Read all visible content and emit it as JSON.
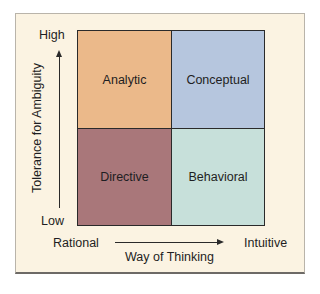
{
  "diagram": {
    "type": "2x2 matrix",
    "y_axis": {
      "title": "Tolerance for Ambiguity",
      "high_label": "High",
      "low_label": "Low"
    },
    "x_axis": {
      "title": "Way of Thinking",
      "left_label": "Rational",
      "right_label": "Intuitive"
    },
    "quadrants": {
      "top_left": {
        "label": "Analytic",
        "color": "#ebb98a"
      },
      "top_right": {
        "label": "Conceptual",
        "color": "#b6c6de"
      },
      "bottom_left": {
        "label": "Directive",
        "color": "#a9777a"
      },
      "bottom_right": {
        "label": "Behavioral",
        "color": "#c7e0da"
      }
    },
    "panel_color": "#fbf3e2"
  }
}
